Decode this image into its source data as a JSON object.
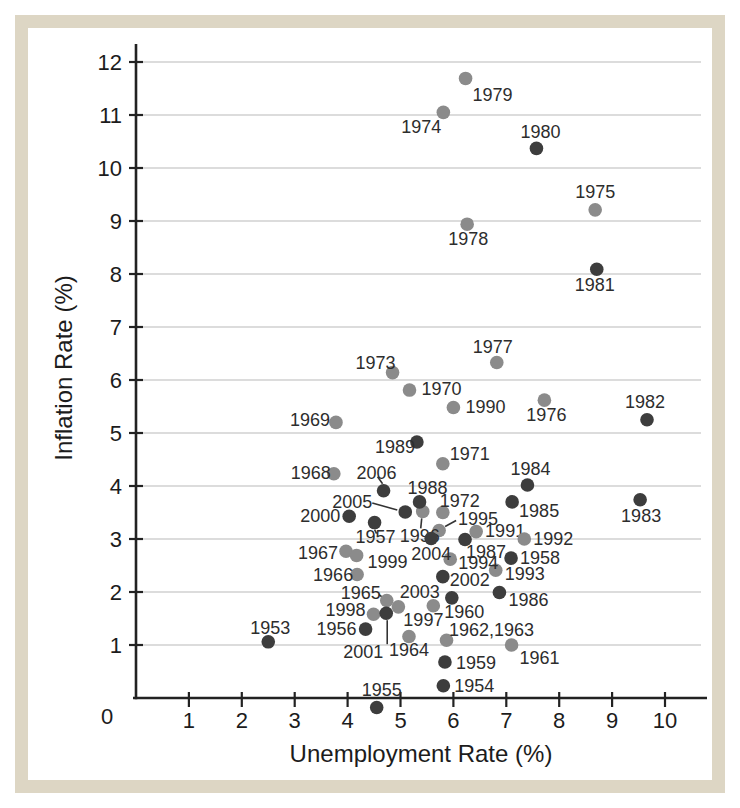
{
  "figure_caption": "",
  "frame": {
    "border_color": "#ddd6c4",
    "background": "#ffffff",
    "inset": 21.5,
    "thickness": 13
  },
  "chart_data": {
    "type": "scatter",
    "title": "",
    "xlabel": "Unemployment Rate (%)",
    "ylabel": "Inflation Rate (%)",
    "xlim": [
      0,
      10.8
    ],
    "ylim": [
      -0.5,
      12.5
    ],
    "x_ticks": [
      1,
      2,
      3,
      4,
      5,
      6,
      7,
      8,
      9,
      10
    ],
    "y_ticks": [
      1,
      2,
      3,
      4,
      5,
      6,
      7,
      8,
      9,
      10,
      11,
      12
    ],
    "origin_label": "0",
    "grid": "horizontal-only",
    "legend_position": "none",
    "colors": {
      "grid": "#b9b9b9",
      "axis": "#222222",
      "label_text": "#2d2d2d",
      "leader": "#333333"
    },
    "mapping": {
      "x0": 136,
      "x_scale": 52.9,
      "y0": 698,
      "y_scale": 53
    },
    "point_radius": 6.8,
    "series": [
      {
        "name": "1960s-1970s and 1990s (light gray dots)",
        "color": "#8b8b8b",
        "points": [
          {
            "year": "1960",
            "x": 5.62,
            "y": 1.74,
            "dx": 31,
            "dy": 6
          },
          {
            "year": "1961",
            "x": 7.1,
            "y": 1.0,
            "dx": 28,
            "dy": 13
          },
          {
            "year": "1962,1963",
            "x": 5.87,
            "y": 1.09,
            "dx": 45,
            "dy": -10
          },
          {
            "year": "1964",
            "x": 5.16,
            "y": 1.16,
            "dx": 0,
            "dy": 13
          },
          {
            "year": "1965",
            "x": 4.74,
            "y": 1.84,
            "dx": -26,
            "dy": -7,
            "lead": [
              -8,
              -6,
              -3,
              -2
            ]
          },
          {
            "year": "1966",
            "x": 4.18,
            "y": 2.33,
            "dx": -24,
            "dy": 0
          },
          {
            "year": "1967",
            "x": 3.97,
            "y": 2.77,
            "dx": -28,
            "dy": 2
          },
          {
            "year": "1968",
            "x": 3.74,
            "y": 4.23,
            "dx": -23,
            "dy": -1
          },
          {
            "year": "1969",
            "x": 3.78,
            "y": 5.2,
            "dx": -26,
            "dy": -2
          },
          {
            "year": "1970",
            "x": 5.17,
            "y": 5.81,
            "dx": 32,
            "dy": -1
          },
          {
            "year": "1971",
            "x": 5.8,
            "y": 4.42,
            "dx": 27,
            "dy": -10
          },
          {
            "year": "1972",
            "x": 5.8,
            "y": 3.5,
            "dx": 17,
            "dy": -12
          },
          {
            "year": "1973",
            "x": 4.85,
            "y": 6.14,
            "dx": -17,
            "dy": -10
          },
          {
            "year": "1974",
            "x": 5.81,
            "y": 11.05,
            "dx": -22,
            "dy": 15
          },
          {
            "year": "1975",
            "x": 8.68,
            "y": 9.21,
            "dx": 0,
            "dy": -18
          },
          {
            "year": "1976",
            "x": 7.72,
            "y": 5.62,
            "dx": 2,
            "dy": 15
          },
          {
            "year": "1977",
            "x": 6.82,
            "y": 6.33,
            "dx": -4,
            "dy": -16
          },
          {
            "year": "1978",
            "x": 6.26,
            "y": 8.94,
            "dx": 1,
            "dy": 15
          },
          {
            "year": "1979",
            "x": 6.23,
            "y": 11.69,
            "dx": 27,
            "dy": 17
          },
          {
            "year": "1990",
            "x": 6.0,
            "y": 5.48,
            "dx": 32,
            "dy": -1
          },
          {
            "year": "1991",
            "x": 6.43,
            "y": 3.14,
            "dx": 29,
            "dy": -1
          },
          {
            "year": "1992",
            "x": 7.34,
            "y": 3.0,
            "dx": 29,
            "dy": 0
          },
          {
            "year": "1993",
            "x": 6.8,
            "y": 2.41,
            "dx": 29,
            "dy": 4
          },
          {
            "year": "1994",
            "x": 5.94,
            "y": 2.62,
            "dx": 28,
            "dy": 4
          },
          {
            "year": "1995",
            "x": 5.73,
            "y": 3.16,
            "dx": 39,
            "dy": -12,
            "lead": [
              6,
              -4,
              17,
              -10
            ]
          },
          {
            "year": "1996",
            "x": 5.42,
            "y": 3.52,
            "dx": -3,
            "dy": 25,
            "lead": [
              -1,
              7,
              -2,
              17
            ]
          },
          {
            "year": "1997",
            "x": 4.96,
            "y": 1.72,
            "dx": 25,
            "dy": 13
          },
          {
            "year": "1998",
            "x": 4.49,
            "y": 1.58,
            "dx": -28,
            "dy": -4
          },
          {
            "year": "1999",
            "x": 4.17,
            "y": 2.69,
            "dx": 31,
            "dy": 7
          }
        ]
      },
      {
        "name": "1950s, 1980s, 2000s (dark dots)",
        "color": "#3d3d3d",
        "points": [
          {
            "year": "1953",
            "x": 2.5,
            "y": 1.06,
            "dx": 2,
            "dy": -14
          },
          {
            "year": "1954",
            "x": 5.81,
            "y": 0.23,
            "dx": 31,
            "dy": 0
          },
          {
            "year": "1955",
            "x": 4.55,
            "y": -0.18,
            "dx": 5,
            "dy": -18
          },
          {
            "year": "1956",
            "x": 4.34,
            "y": 1.3,
            "dx": -29,
            "dy": 0
          },
          {
            "year": "1957",
            "x": 4.51,
            "y": 3.31,
            "dx": 1,
            "dy": 14,
            "lead": [
              0,
              7,
              2,
              11
            ]
          },
          {
            "year": "1958",
            "x": 7.09,
            "y": 2.64,
            "dx": 29,
            "dy": 0
          },
          {
            "year": "1959",
            "x": 5.84,
            "y": 0.68,
            "dx": 31,
            "dy": 1
          },
          {
            "year": "1980",
            "x": 7.57,
            "y": 10.37,
            "dx": 4,
            "dy": -16
          },
          {
            "year": "1981",
            "x": 8.71,
            "y": 8.09,
            "dx": -2,
            "dy": 16
          },
          {
            "year": "1982",
            "x": 9.66,
            "y": 5.25,
            "dx": -2,
            "dy": -18
          },
          {
            "year": "1983",
            "x": 9.53,
            "y": 3.74,
            "dx": 1,
            "dy": 16
          },
          {
            "year": "1984",
            "x": 7.4,
            "y": 4.02,
            "dx": 3,
            "dy": -16
          },
          {
            "year": "1985",
            "x": 7.11,
            "y": 3.7,
            "dx": 27,
            "dy": 9
          },
          {
            "year": "1986",
            "x": 6.87,
            "y": 1.99,
            "dx": 29,
            "dy": 7
          },
          {
            "year": "1987",
            "x": 6.22,
            "y": 2.99,
            "dx": 21,
            "dy": 12
          },
          {
            "year": "1988",
            "x": 5.36,
            "y": 3.7,
            "dx": 8,
            "dy": -14
          },
          {
            "year": "1989",
            "x": 5.31,
            "y": 4.83,
            "dx": -22,
            "dy": 5
          },
          {
            "year": "2000",
            "x": 4.03,
            "y": 3.43,
            "dx": -29,
            "dy": 0
          },
          {
            "year": "2001",
            "x": 4.73,
            "y": 1.6,
            "dx": -23,
            "dy": 39,
            "lead": [
              1,
              7,
              1,
              31
            ]
          },
          {
            "year": "2002",
            "x": 5.8,
            "y": 2.29,
            "dx": 27,
            "dy": 3
          },
          {
            "year": "2003",
            "x": 5.97,
            "y": 1.89,
            "dx": -32,
            "dy": -6
          },
          {
            "year": "2004",
            "x": 5.58,
            "y": 3.01,
            "dx": 0,
            "dy": 16
          },
          {
            "year": "2005",
            "x": 5.09,
            "y": 3.51,
            "dx": -53,
            "dy": -10,
            "lead": [
              -33,
              -9,
              -8,
              -2
            ]
          },
          {
            "year": "2006",
            "x": 4.68,
            "y": 3.91,
            "dx": -7,
            "dy": -18,
            "lead": [
              -6,
              -14,
              -1,
              -7
            ]
          }
        ]
      }
    ]
  }
}
